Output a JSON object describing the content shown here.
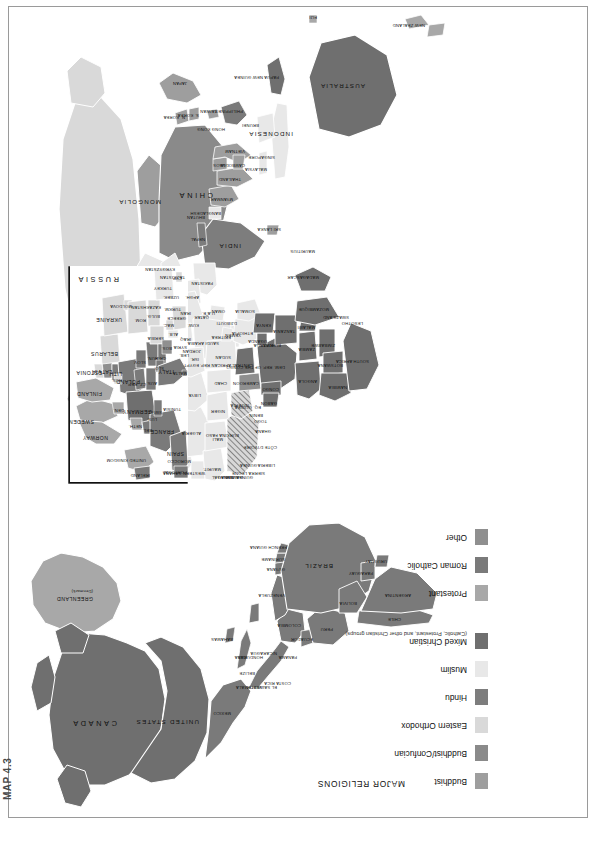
{
  "figure": {
    "number": "MAP 4.3"
  },
  "legend": {
    "title": "MAJOR RELIGIONS",
    "items": [
      {
        "label": "Buddhist",
        "sub": "",
        "color": "#9e9e9e"
      },
      {
        "label": "Buddhist/Confucian",
        "sub": "",
        "color": "#8a8a8a"
      },
      {
        "label": "Eastern Orthodox",
        "sub": "",
        "color": "#d9d9d9"
      },
      {
        "label": "Hindu",
        "sub": "",
        "color": "#7d7d7d"
      },
      {
        "label": "Muslim",
        "sub": "",
        "color": "#e8e8e8"
      },
      {
        "label": "Mixed Christian",
        "sub": "(Catholic, Protestant, and other Christian groups)",
        "color": "#6f6f6f"
      },
      {
        "label": "Protestant",
        "sub": "",
        "color": "#a8a8a8"
      },
      {
        "label": "Roman Catholic",
        "sub": "",
        "color": "#7a7a7a"
      },
      {
        "label": "Other",
        "sub": "",
        "color": "#8f8f8f"
      }
    ]
  },
  "map": {
    "projection_note": "world map, page printed in landscape (rotated 90°)",
    "inset": {
      "name": "Europe inset",
      "label": ""
    },
    "regions": {
      "north_america": [
        {
          "name": "CANADA",
          "religion": "Mixed Christian"
        },
        {
          "name": "UNITED STATES",
          "religion": "Mixed Christian"
        },
        {
          "name": "GREENLAND",
          "sub": "(Denmark)",
          "religion": "Protestant"
        },
        {
          "name": "MEXICO",
          "religion": "Roman Catholic"
        }
      ],
      "central_america_caribbean": [
        {
          "name": "BAHAMAS"
        },
        {
          "name": "CUBA"
        },
        {
          "name": "BELIZE"
        },
        {
          "name": "GUATEMALA"
        },
        {
          "name": "HONDURAS"
        },
        {
          "name": "EL SALVADOR"
        },
        {
          "name": "NICARAGUA"
        },
        {
          "name": "COSTA RICA"
        },
        {
          "name": "PANAMA"
        }
      ],
      "south_america": [
        {
          "name": "VENEZUELA"
        },
        {
          "name": "COLOMBIA"
        },
        {
          "name": "GUYANA"
        },
        {
          "name": "SURINAME"
        },
        {
          "name": "FRENCH GUIANA"
        },
        {
          "name": "ECUADOR"
        },
        {
          "name": "PERU"
        },
        {
          "name": "BRAZIL"
        },
        {
          "name": "BOLIVIA"
        },
        {
          "name": "PARAGUAY"
        },
        {
          "name": "CHILE"
        },
        {
          "name": "ARGENTINA"
        },
        {
          "name": "URUGUAY"
        }
      ],
      "europe": [
        {
          "name": "ICELAND"
        },
        {
          "name": "NORWAY"
        },
        {
          "name": "SWEDEN"
        },
        {
          "name": "FINLAND"
        },
        {
          "name": "DEN."
        },
        {
          "name": "IRELAND"
        },
        {
          "name": "UNITED KINGDOM"
        },
        {
          "name": "NETH."
        },
        {
          "name": "BEL."
        },
        {
          "name": "LUX."
        },
        {
          "name": "FRANCE"
        },
        {
          "name": "SPAIN"
        },
        {
          "name": "PORTUGAL"
        },
        {
          "name": "GERMANY"
        },
        {
          "name": "SWITZ."
        },
        {
          "name": "AUS."
        },
        {
          "name": "ITALY"
        },
        {
          "name": "CZ. REP."
        },
        {
          "name": "SLOV."
        },
        {
          "name": "POLAND"
        },
        {
          "name": "HUN."
        },
        {
          "name": "SLO."
        },
        {
          "name": "CRO."
        },
        {
          "name": "BOS."
        },
        {
          "name": "SERBIA"
        },
        {
          "name": "ALB."
        },
        {
          "name": "MAC."
        },
        {
          "name": "GREECE"
        },
        {
          "name": "BULG."
        },
        {
          "name": "ROM."
        },
        {
          "name": "MOLDOVA"
        },
        {
          "name": "UKRAINE"
        },
        {
          "name": "BELARUS"
        },
        {
          "name": "LITH."
        },
        {
          "name": "LATVIA"
        },
        {
          "name": "ESTONIA"
        },
        {
          "name": "RUS."
        },
        {
          "name": "MALTA"
        },
        {
          "name": "CYP."
        },
        {
          "name": "TURKEY"
        }
      ],
      "asia": [
        {
          "name": "RUSSIA",
          "religion": "Eastern Orthodox"
        },
        {
          "name": "KAZAKHSTAN"
        },
        {
          "name": "UZBEK."
        },
        {
          "name": "TURKM."
        },
        {
          "name": "KYRGYZSTAN"
        },
        {
          "name": "TAJIKISTAN"
        },
        {
          "name": "MONGOLIA"
        },
        {
          "name": "CHINA"
        },
        {
          "name": "N. KOREA"
        },
        {
          "name": "S. KOREA"
        },
        {
          "name": "JAPAN"
        },
        {
          "name": "TAIWAN"
        },
        {
          "name": "HONG KONG"
        },
        {
          "name": "AFGH."
        },
        {
          "name": "PAKISTAN"
        },
        {
          "name": "NEPAL"
        },
        {
          "name": "BHUTAN"
        },
        {
          "name": "INDIA",
          "religion": "Hindu"
        },
        {
          "name": "BANGLADESH"
        },
        {
          "name": "SRI LANKA"
        },
        {
          "name": "MYANMAR"
        },
        {
          "name": "THAILAND"
        },
        {
          "name": "LAOS"
        },
        {
          "name": "VIETNAM"
        },
        {
          "name": "CAMBODIA"
        },
        {
          "name": "MALAYSIA"
        },
        {
          "name": "SINGAPORE"
        },
        {
          "name": "BRUNEI"
        },
        {
          "name": "INDONESIA"
        },
        {
          "name": "PHILIPPINES"
        },
        {
          "name": "PAPUA NEW GUINEA"
        }
      ],
      "middle_east": [
        {
          "name": "IRAQ"
        },
        {
          "name": "IRAN"
        },
        {
          "name": "SYRIA"
        },
        {
          "name": "LEB."
        },
        {
          "name": "ISR."
        },
        {
          "name": "JORDAN"
        },
        {
          "name": "SAUDI ARABIA"
        },
        {
          "name": "KUW."
        },
        {
          "name": "QATAR"
        },
        {
          "name": "U.A.E."
        },
        {
          "name": "OMAN"
        },
        {
          "name": "YEMEN"
        },
        {
          "name": "GEORGIA"
        },
        {
          "name": "ARM."
        },
        {
          "name": "AZER."
        }
      ],
      "africa": [
        {
          "name": "MOROCCO"
        },
        {
          "name": "WESTERN SAHARA"
        },
        {
          "name": "ALGERIA"
        },
        {
          "name": "TUNISIA"
        },
        {
          "name": "LIBYA"
        },
        {
          "name": "EGYPT"
        },
        {
          "name": "MAURIT."
        },
        {
          "name": "MALI"
        },
        {
          "name": "NIGER"
        },
        {
          "name": "CHAD"
        },
        {
          "name": "SUDAN"
        },
        {
          "name": "ERITREA"
        },
        {
          "name": "DJIBOUTI"
        },
        {
          "name": "ETHIOPIA"
        },
        {
          "name": "SOMALIA"
        },
        {
          "name": "SENEGAL"
        },
        {
          "name": "GAMBIA"
        },
        {
          "name": "GUINEA-BISSAU"
        },
        {
          "name": "GUINEA"
        },
        {
          "name": "SIERRA LEONE"
        },
        {
          "name": "LIBERIA"
        },
        {
          "name": "CÔTE D'IVOIRE"
        },
        {
          "name": "GHANA"
        },
        {
          "name": "TOGO"
        },
        {
          "name": "BENIN"
        },
        {
          "name": "BURKINA FASO"
        },
        {
          "name": "NIGERIA"
        },
        {
          "name": "CAMEROON"
        },
        {
          "name": "CENTRAL AFRICAN REP."
        },
        {
          "name": "EQ. GUINEA"
        },
        {
          "name": "GABON"
        },
        {
          "name": "CONGO"
        },
        {
          "name": "DEM. REP. OF THE CONGO"
        },
        {
          "name": "UGANDA"
        },
        {
          "name": "KENYA"
        },
        {
          "name": "RWANDA"
        },
        {
          "name": "BURUNDI"
        },
        {
          "name": "TANZANIA"
        },
        {
          "name": "ANGOLA"
        },
        {
          "name": "ZAMBIA"
        },
        {
          "name": "MALAWI"
        },
        {
          "name": "MOZAMBIQUE"
        },
        {
          "name": "ZIMBABWE"
        },
        {
          "name": "BOTSWANA"
        },
        {
          "name": "NAMIBIA"
        },
        {
          "name": "SOUTH AFRICA"
        },
        {
          "name": "SWAZILAND"
        },
        {
          "name": "LESOTHO"
        },
        {
          "name": "MADAGASCAR"
        },
        {
          "name": "MAURITIUS"
        }
      ],
      "oceania": [
        {
          "name": "AUSTRALIA",
          "religion": "Mixed Christian"
        },
        {
          "name": "NEW ZEALAND",
          "religion": "Protestant"
        },
        {
          "name": "FIJI"
        }
      ]
    }
  }
}
